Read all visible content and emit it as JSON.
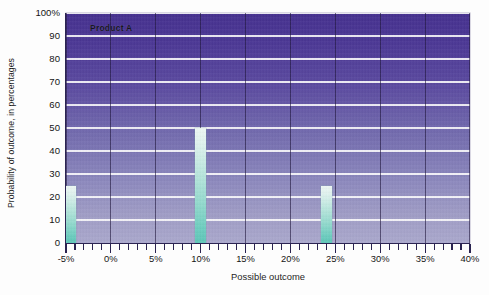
{
  "chart_data": {
    "type": "bar",
    "title": "",
    "series_label": "Product A",
    "xlabel": "Possible outcome",
    "ylabel": "Probability of outcome, in percentages",
    "xlim": [
      -5,
      40
    ],
    "ylim": [
      0,
      100
    ],
    "x_major_step": 5,
    "x_minor_step": 1,
    "y_major_step": 10,
    "grid": "both",
    "legend": "none",
    "x_tick_labels": [
      "-5%",
      "0%",
      "5%",
      "10%",
      "15%",
      "20%",
      "25%",
      "30%",
      "35%",
      "40%"
    ],
    "x_tick_values": [
      -5,
      0,
      5,
      10,
      15,
      20,
      25,
      30,
      35,
      40
    ],
    "y_tick_labels": [
      "100%",
      "90",
      "80",
      "70",
      "60",
      "50",
      "40",
      "30",
      "20",
      "10",
      "0"
    ],
    "y_tick_values": [
      100,
      90,
      80,
      70,
      60,
      50,
      40,
      30,
      20,
      10,
      0
    ],
    "x": [
      -4.5,
      10,
      24
    ],
    "values": [
      25,
      50,
      25
    ],
    "bar_width_pct": 1.2,
    "points": [
      {
        "outcome": "-4.5%",
        "probability": 25
      },
      {
        "outcome": "10%",
        "probability": 50
      },
      {
        "outcome": "24%",
        "probability": 25
      }
    ],
    "colors": {
      "plot_background_top": "#45308f",
      "plot_background_bottom": "#aaa8cd",
      "bar_top": "#eef7f4",
      "bar_bottom": "#5ec6b8",
      "hgrid": "#ffffff",
      "vgrid": "#201640",
      "axis": "#2b2352",
      "text": "#151515",
      "page_background": "#fdfdfd"
    }
  }
}
